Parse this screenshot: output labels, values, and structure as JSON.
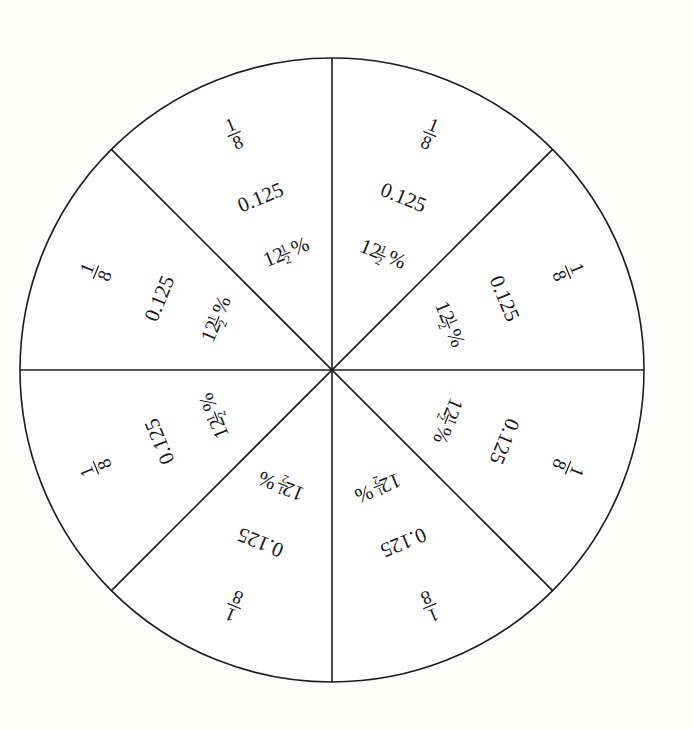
{
  "figure": {
    "shape": "circle",
    "slice_count": 8,
    "stroke_color": "#1b1c20",
    "fill_color": "#ffffff",
    "background_color": "#fdfdfc",
    "center_x": 332,
    "center_y": 370,
    "radius": 312
  },
  "labels": {
    "fraction_numerator": "1",
    "fraction_denominator": "8",
    "decimal": "0.125",
    "percent_whole": "12",
    "percent_frac_numerator": "1",
    "percent_frac_denominator": "2",
    "percent_sign": "%"
  },
  "chart_data": {
    "type": "pie",
    "categories": [
      "1/8",
      "1/8",
      "1/8",
      "1/8",
      "1/8",
      "1/8",
      "1/8",
      "1/8"
    ],
    "values": [
      12.5,
      12.5,
      12.5,
      12.5,
      12.5,
      12.5,
      12.5,
      12.5
    ],
    "value_unit": "percent",
    "slice_labels": [
      {
        "fraction": "1/8",
        "decimal": "0.125",
        "percent": "12 1/2 %"
      },
      {
        "fraction": "1/8",
        "decimal": "0.125",
        "percent": "12 1/2 %"
      },
      {
        "fraction": "1/8",
        "decimal": "0.125",
        "percent": "12 1/2 %"
      },
      {
        "fraction": "1/8",
        "decimal": "0.125",
        "percent": "12 1/2 %"
      },
      {
        "fraction": "1/8",
        "decimal": "0.125",
        "percent": "12 1/2 %"
      },
      {
        "fraction": "1/8",
        "decimal": "0.125",
        "percent": "12 1/2 %"
      },
      {
        "fraction": "1/8",
        "decimal": "0.125",
        "percent": "12 1/2 %"
      },
      {
        "fraction": "1/8",
        "decimal": "0.125",
        "percent": "12 1/2 %"
      }
    ],
    "legend": null,
    "grid": false,
    "xlabel": "",
    "ylabel": ""
  },
  "slices": [
    {
      "index": 0,
      "bisector_deg": -67.5,
      "text_rotation_deg": 22.5,
      "position": "top-right-upper"
    },
    {
      "index": 1,
      "bisector_deg": -22.5,
      "text_rotation_deg": 67.5,
      "position": "right-upper"
    },
    {
      "index": 2,
      "bisector_deg": 22.5,
      "text_rotation_deg": 112.5,
      "position": "right-lower"
    },
    {
      "index": 3,
      "bisector_deg": 67.5,
      "text_rotation_deg": 157.5,
      "position": "bottom-right"
    },
    {
      "index": 4,
      "bisector_deg": 112.5,
      "text_rotation_deg": 202.5,
      "position": "bottom-left"
    },
    {
      "index": 5,
      "bisector_deg": 157.5,
      "text_rotation_deg": 247.5,
      "position": "left-lower"
    },
    {
      "index": 6,
      "bisector_deg": 202.5,
      "text_rotation_deg": 292.5,
      "position": "left-upper"
    },
    {
      "index": 7,
      "bisector_deg": 247.5,
      "text_rotation_deg": 337.5,
      "position": "top-left-upper"
    }
  ]
}
